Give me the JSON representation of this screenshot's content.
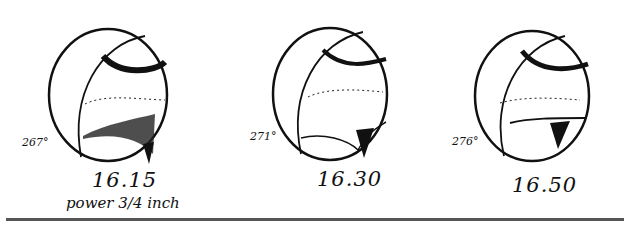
{
  "figures": [
    {
      "longitude": "267°",
      "time": "16.15",
      "note": "power 3/4 inch"
    },
    {
      "longitude": "271°",
      "time": "16.30"
    },
    {
      "longitude": "276°",
      "time": "16.50"
    }
  ],
  "colors": {
    "ink": "#111111",
    "paper": "#ffffff",
    "rule": "#555555"
  }
}
